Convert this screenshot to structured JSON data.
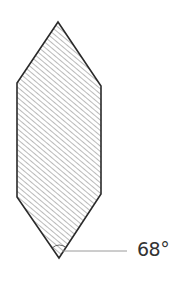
{
  "diagram": {
    "shape": "elongated hexagon (tool bit cross-section) with diagonal hatching",
    "angle_label": "68°",
    "colors": {
      "outline": "#2a2a2a",
      "hatch": "#555555",
      "leader": "#9a9a9a",
      "text": "#333333",
      "background": "#ffffff"
    }
  }
}
